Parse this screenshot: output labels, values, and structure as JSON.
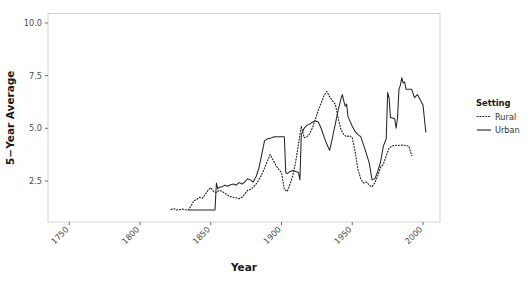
{
  "chart_data": {
    "type": "line",
    "title": "",
    "xlabel": "Year",
    "ylabel": "5−Year Average",
    "xlim": [
      1735,
      2012
    ],
    "ylim": [
      0.55,
      10.45
    ],
    "xticks": [
      1750,
      1800,
      1850,
      1900,
      1950,
      2000
    ],
    "xticklabels": [
      "1750",
      "1800",
      "1850",
      "1900",
      "1950",
      "2000"
    ],
    "yticks": [
      2.5,
      5.0,
      7.5,
      10.0
    ],
    "yticklabels": [
      "2.5",
      "5.0",
      "7.5",
      "10.0"
    ],
    "grid": false,
    "legend": {
      "title": "Setting",
      "position": "right",
      "entries": [
        {
          "name": "Rural",
          "linestyle": "dotted",
          "color": "#262626"
        },
        {
          "name": "Urban",
          "linestyle": "solid",
          "color": "#262626"
        }
      ]
    },
    "series": [
      {
        "name": "Rural",
        "linestyle": "dotted",
        "color": "#262626",
        "x": [
          1822,
          1824,
          1826,
          1828,
          1830,
          1832,
          1834,
          1836,
          1838,
          1840,
          1842,
          1844,
          1846,
          1848,
          1850,
          1852,
          1854,
          1856,
          1858,
          1860,
          1862,
          1864,
          1866,
          1868,
          1870,
          1872,
          1874,
          1876,
          1878,
          1880,
          1882,
          1884,
          1886,
          1888,
          1890,
          1892,
          1894,
          1896,
          1898,
          1900,
          1902,
          1904,
          1906,
          1908,
          1910,
          1912,
          1914,
          1916,
          1918,
          1920,
          1922,
          1924,
          1926,
          1928,
          1930,
          1932,
          1934,
          1936,
          1938,
          1940,
          1942,
          1944,
          1946,
          1948,
          1950,
          1952,
          1954,
          1956,
          1958,
          1960,
          1962,
          1964,
          1966,
          1968,
          1970,
          1972,
          1974,
          1976,
          1978,
          1980,
          1982,
          1984,
          1986,
          1988,
          1990,
          1992
        ],
        "y": [
          1.15,
          1.18,
          1.12,
          1.14,
          1.16,
          1.13,
          1.12,
          1.3,
          1.55,
          1.62,
          1.72,
          1.68,
          1.85,
          2.05,
          2.18,
          2.0,
          1.95,
          2.05,
          2.0,
          1.92,
          1.82,
          1.75,
          1.72,
          1.7,
          1.66,
          1.72,
          1.88,
          2.05,
          2.1,
          2.2,
          2.35,
          2.55,
          2.8,
          3.1,
          3.45,
          3.75,
          3.5,
          3.25,
          3.05,
          2.9,
          2.1,
          2.0,
          2.35,
          2.75,
          3.4,
          4.25,
          5.1,
          4.55,
          4.6,
          4.75,
          5.05,
          5.45,
          5.85,
          6.2,
          6.55,
          6.75,
          6.5,
          6.3,
          6.15,
          5.5,
          4.95,
          4.7,
          4.6,
          4.65,
          4.55,
          3.9,
          3.05,
          2.6,
          2.4,
          2.45,
          2.3,
          2.22,
          2.42,
          2.75,
          3.15,
          3.3,
          3.7,
          4.05,
          4.15,
          4.2,
          4.18,
          4.2,
          4.2,
          4.18,
          4.15,
          3.7
        ]
      },
      {
        "name": "Urban",
        "linestyle": "solid",
        "color": "#262626",
        "x": [
          1834,
          1836,
          1838,
          1840,
          1842,
          1844,
          1846,
          1848,
          1850,
          1852,
          1853,
          1854,
          1855,
          1856,
          1858,
          1860,
          1862,
          1864,
          1866,
          1868,
          1870,
          1872,
          1874,
          1876,
          1878,
          1880,
          1882,
          1884,
          1886,
          1888,
          1890,
          1892,
          1894,
          1896,
          1898,
          1900,
          1902,
          1903,
          1904,
          1906,
          1908,
          1910,
          1912,
          1913,
          1914,
          1916,
          1918,
          1920,
          1922,
          1924,
          1926,
          1928,
          1930,
          1932,
          1934,
          1936,
          1938,
          1940,
          1942,
          1943,
          1944,
          1945,
          1946,
          1947,
          1948,
          1950,
          1952,
          1954,
          1956,
          1958,
          1960,
          1962,
          1964,
          1966,
          1968,
          1970,
          1972,
          1974,
          1975,
          1976,
          1977,
          1978,
          1980,
          1981,
          1982,
          1983,
          1984,
          1985,
          1986,
          1987,
          1988,
          1990,
          1992,
          1994,
          1996,
          1998,
          2000,
          2002
        ],
        "y": [
          1.12,
          1.12,
          1.12,
          1.12,
          1.12,
          1.12,
          1.12,
          1.12,
          1.12,
          1.12,
          1.12,
          2.4,
          2.12,
          2.2,
          2.22,
          2.3,
          2.25,
          2.32,
          2.35,
          2.3,
          2.42,
          2.35,
          2.45,
          2.6,
          2.55,
          2.45,
          2.7,
          3.1,
          3.75,
          4.4,
          4.5,
          4.52,
          4.58,
          4.6,
          4.6,
          4.6,
          4.6,
          2.9,
          2.85,
          2.95,
          3.0,
          2.95,
          2.9,
          2.55,
          4.7,
          5.0,
          5.15,
          5.2,
          5.3,
          5.35,
          5.3,
          5.0,
          4.6,
          4.25,
          3.95,
          4.55,
          5.2,
          5.85,
          6.4,
          6.6,
          6.3,
          6.05,
          6.15,
          5.55,
          5.4,
          5.1,
          4.85,
          4.7,
          4.6,
          4.2,
          3.8,
          3.35,
          2.55,
          2.6,
          2.95,
          3.4,
          4.15,
          4.5,
          6.7,
          6.45,
          5.5,
          5.5,
          5.45,
          5.0,
          5.5,
          6.85,
          7.05,
          7.4,
          7.15,
          7.2,
          6.85,
          6.85,
          6.85,
          6.45,
          6.6,
          6.35,
          6.1,
          4.8
        ]
      }
    ]
  }
}
